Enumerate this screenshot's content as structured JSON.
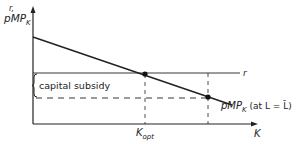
{
  "diagram": {
    "y_axis_label_top": "r,",
    "y_axis_label_main": "pMP",
    "y_axis_label_sub": "K",
    "x_axis_label": "K",
    "r_line_label": "r",
    "subsidy_label": "capital subsidy",
    "curve_label_main": "pMP",
    "curve_label_sub": "K",
    "curve_label_suffix": " (at L = L̄)",
    "kopt_label_main": "K",
    "kopt_label_sub": "opt",
    "colors": {
      "line": "#222222",
      "background": "#ffffff"
    }
  }
}
